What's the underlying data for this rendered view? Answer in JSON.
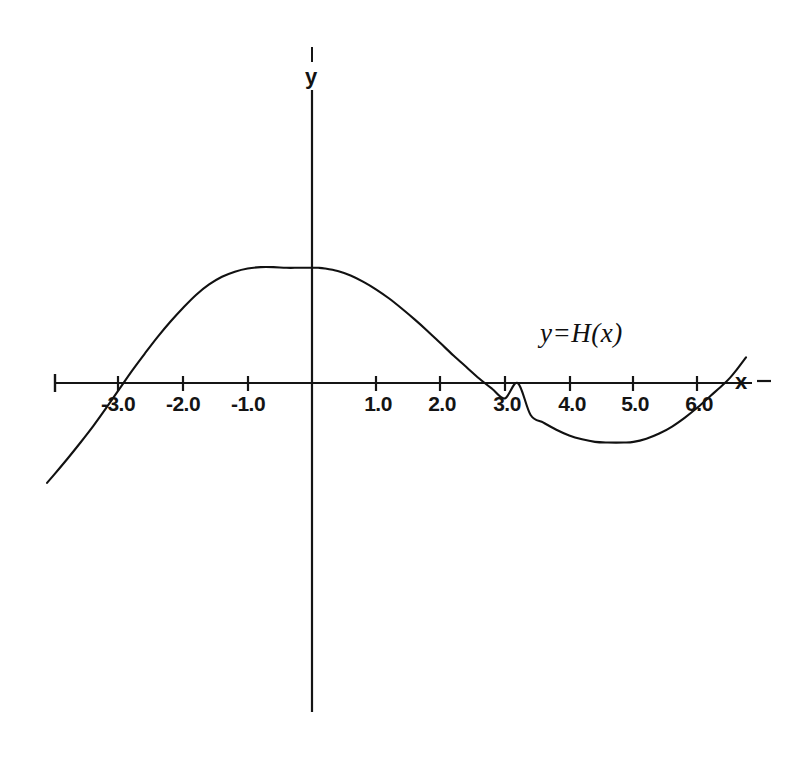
{
  "chart_data": {
    "type": "line",
    "title": "",
    "subtitle": "",
    "xlabel": "x",
    "ylabel": "y",
    "annotations": [
      {
        "text": "y=H(x)",
        "x": 4.1,
        "y": 0.72
      }
    ],
    "grid": false,
    "legend": false,
    "legend_position": "none",
    "xlim": [
      -4.1,
      6.75
    ],
    "ylim": [
      -1.6,
      4.6
    ],
    "xticks": [
      -3.0,
      -2.0,
      -1.0,
      1.0,
      2.0,
      3.0,
      4.0,
      5.0,
      6.0
    ],
    "xtick_labels": [
      "-3.0",
      "-2.0",
      "-1.0",
      "1.0",
      "2.0",
      "3.0",
      "4.0",
      "5.0",
      "6.0"
    ],
    "yticks": [],
    "ytick_labels": [],
    "zeros": [
      -3.0,
      3.2,
      6.5
    ],
    "maximum": {
      "x": 0.1,
      "y": 1.8
    },
    "minimum": {
      "x": 4.85,
      "y": -0.93
    },
    "series": [
      {
        "name": "y=H(x)",
        "color": "#111111",
        "x": [
          -4.12,
          -4.0,
          -3.8,
          -3.6,
          -3.4,
          -3.2,
          -3.0,
          -2.8,
          -2.6,
          -2.4,
          -2.2,
          -2.0,
          -1.8,
          -1.6,
          -1.4,
          -1.2,
          -1.0,
          -0.8,
          -0.6,
          -0.4,
          -0.2,
          0.0,
          0.1,
          0.2,
          0.4,
          0.6,
          0.8,
          1.0,
          1.2,
          1.4,
          1.6,
          1.8,
          2.0,
          2.2,
          2.4,
          2.6,
          2.8,
          3.0,
          3.2,
          3.4,
          3.6,
          3.8,
          4.0,
          4.2,
          4.4,
          4.6,
          4.85,
          5.0,
          5.2,
          5.4,
          5.6,
          5.8,
          6.0,
          6.2,
          6.4,
          6.5,
          6.6,
          6.75
        ],
        "y": [
          -1.56,
          -1.42,
          -1.18,
          -0.93,
          -0.67,
          -0.39,
          -0.1,
          0.19,
          0.46,
          0.72,
          0.96,
          1.18,
          1.38,
          1.54,
          1.66,
          1.74,
          1.79,
          1.81,
          1.81,
          1.8,
          1.8,
          1.8,
          1.8,
          1.79,
          1.75,
          1.68,
          1.58,
          1.46,
          1.32,
          1.16,
          0.99,
          0.81,
          0.62,
          0.43,
          0.25,
          0.07,
          -0.09,
          -0.24,
          0.0,
          -0.5,
          -0.62,
          -0.73,
          -0.82,
          -0.88,
          -0.92,
          -0.93,
          -0.93,
          -0.92,
          -0.87,
          -0.79,
          -0.68,
          -0.54,
          -0.38,
          -0.2,
          -0.02,
          0.08,
          0.2,
          0.4
        ]
      }
    ]
  },
  "axes": {
    "x_axis_label": "x",
    "y_axis_label": "y",
    "x_axis_end_mark": "-"
  },
  "colors": {
    "curve": "#111111",
    "axis": "#151515",
    "background": "#ffffff",
    "text": "#121212"
  }
}
